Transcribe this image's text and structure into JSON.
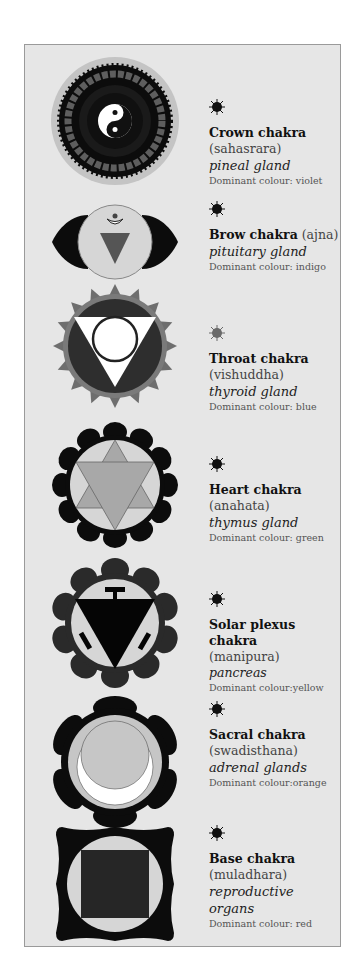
{
  "chakras": [
    {
      "name": "Crown chakra",
      "sanskrit": "(sahasrara)",
      "gland": "pineal gland",
      "dominant": "Dominant colour: violet",
      "star_color": "#111111"
    },
    {
      "name": "Brow chakra",
      "sanskrit": "(ajna)",
      "gland": "pituitary gland",
      "dominant": "Dominant colour: indigo",
      "star_color": "#111111"
    },
    {
      "name": "Throat chakra",
      "sanskrit": "(vishuddha)",
      "gland": "thyroid gland",
      "dominant": "Dominant colour: blue",
      "star_color": "#6a6a6a"
    },
    {
      "name": "Heart chakra",
      "sanskrit": "(anahata)",
      "gland": "thymus gland",
      "dominant": "Dominant colour: green",
      "star_color": "#111111"
    },
    {
      "name": "Solar plexus chakra",
      "sanskrit": "(manipura)",
      "gland": "pancreas",
      "dominant": "Dominant colour:yellow",
      "star_color": "#111111"
    },
    {
      "name": "Sacral chakra",
      "sanskrit": "(swadisthana)",
      "gland": "adrenal glands",
      "dominant": "Dominant colour:orange",
      "star_color": "#111111"
    },
    {
      "name": "Base chakra",
      "sanskrit": "(muladhara)",
      "gland": "reproductive organs",
      "dominant": "Dominant colour: red",
      "star_color": "#111111"
    }
  ]
}
